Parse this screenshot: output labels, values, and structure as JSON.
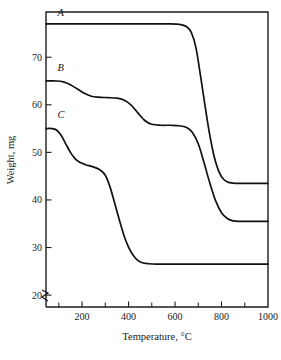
{
  "figure": {
    "kind": "thermogravimetric-analysis-plot",
    "background_color": "#ffffff",
    "line_color": "#111111",
    "axis_color": "#1d1d1d",
    "axis_break_symbol": "zigzag-break"
  },
  "chart_data": {
    "type": "line",
    "title": "",
    "subtitle": "",
    "xlabel": "Temperature, °C",
    "ylabel": "Weight, mg",
    "xlim": [
      45,
      1000
    ],
    "ylim": [
      17.5,
      79.5
    ],
    "grid": false,
    "legend": "inline-curve-labels",
    "x_ticks_major": [
      200,
      400,
      600,
      800,
      1000
    ],
    "x_tick_labels": [
      "200",
      "400",
      "600",
      "800",
      "1000"
    ],
    "x_ticks_minor": [
      100,
      300,
      500,
      700,
      900
    ],
    "y_ticks_major": [
      20,
      30,
      40,
      50,
      60,
      70
    ],
    "y_tick_labels": [
      "20",
      "30",
      "40",
      "50",
      "60",
      "70"
    ],
    "y_axis_break": true,
    "annotations": [
      {
        "text": "A",
        "x": 95,
        "y": 78.6,
        "series": "A"
      },
      {
        "text": "B",
        "x": 95,
        "y": 67.2,
        "series": "B"
      },
      {
        "text": "C",
        "x": 95,
        "y": 57.2,
        "series": "C"
      }
    ],
    "series": [
      {
        "name": "A",
        "label": "A",
        "initial_weight": 77.0,
        "final_weight": 43.5,
        "points": [
          [
            45,
            77.0
          ],
          [
            100,
            77.0
          ],
          [
            200,
            77.0
          ],
          [
            300,
            77.0
          ],
          [
            400,
            77.0
          ],
          [
            500,
            77.0
          ],
          [
            570,
            77.0
          ],
          [
            620,
            76.9
          ],
          [
            650,
            76.4
          ],
          [
            670,
            75.2
          ],
          [
            690,
            72.0
          ],
          [
            710,
            66.0
          ],
          [
            730,
            59.5
          ],
          [
            750,
            53.5
          ],
          [
            770,
            48.8
          ],
          [
            790,
            45.8
          ],
          [
            810,
            44.3
          ],
          [
            830,
            43.7
          ],
          [
            860,
            43.5
          ],
          [
            900,
            43.5
          ],
          [
            950,
            43.5
          ],
          [
            1000,
            43.5
          ]
        ]
      },
      {
        "name": "B",
        "label": "B",
        "initial_weight": 65.0,
        "final_weight": 35.5,
        "points": [
          [
            45,
            65.0
          ],
          [
            90,
            65.0
          ],
          [
            120,
            64.8
          ],
          [
            150,
            64.2
          ],
          [
            180,
            63.3
          ],
          [
            210,
            62.4
          ],
          [
            240,
            61.8
          ],
          [
            270,
            61.6
          ],
          [
            310,
            61.5
          ],
          [
            350,
            61.4
          ],
          [
            380,
            61.0
          ],
          [
            410,
            60.0
          ],
          [
            440,
            58.3
          ],
          [
            470,
            56.7
          ],
          [
            500,
            55.9
          ],
          [
            540,
            55.7
          ],
          [
            580,
            55.7
          ],
          [
            620,
            55.6
          ],
          [
            650,
            55.2
          ],
          [
            675,
            54.2
          ],
          [
            700,
            51.8
          ],
          [
            725,
            47.8
          ],
          [
            750,
            43.5
          ],
          [
            775,
            39.8
          ],
          [
            800,
            37.3
          ],
          [
            825,
            36.1
          ],
          [
            850,
            35.6
          ],
          [
            880,
            35.5
          ],
          [
            930,
            35.5
          ],
          [
            1000,
            35.5
          ]
        ]
      },
      {
        "name": "C",
        "label": "C",
        "initial_weight": 55.0,
        "final_weight": 26.5,
        "points": [
          [
            45,
            55.0
          ],
          [
            70,
            55.0
          ],
          [
            90,
            54.7
          ],
          [
            110,
            53.6
          ],
          [
            130,
            51.8
          ],
          [
            150,
            50.0
          ],
          [
            170,
            48.7
          ],
          [
            190,
            47.9
          ],
          [
            215,
            47.4
          ],
          [
            245,
            47.0
          ],
          [
            275,
            46.4
          ],
          [
            300,
            45.2
          ],
          [
            320,
            42.8
          ],
          [
            340,
            39.4
          ],
          [
            360,
            35.9
          ],
          [
            380,
            32.6
          ],
          [
            400,
            30.1
          ],
          [
            420,
            28.4
          ],
          [
            440,
            27.3
          ],
          [
            460,
            26.8
          ],
          [
            485,
            26.6
          ],
          [
            520,
            26.5
          ],
          [
            600,
            26.5
          ],
          [
            700,
            26.5
          ],
          [
            800,
            26.5
          ],
          [
            900,
            26.5
          ],
          [
            1000,
            26.5
          ]
        ]
      }
    ]
  }
}
